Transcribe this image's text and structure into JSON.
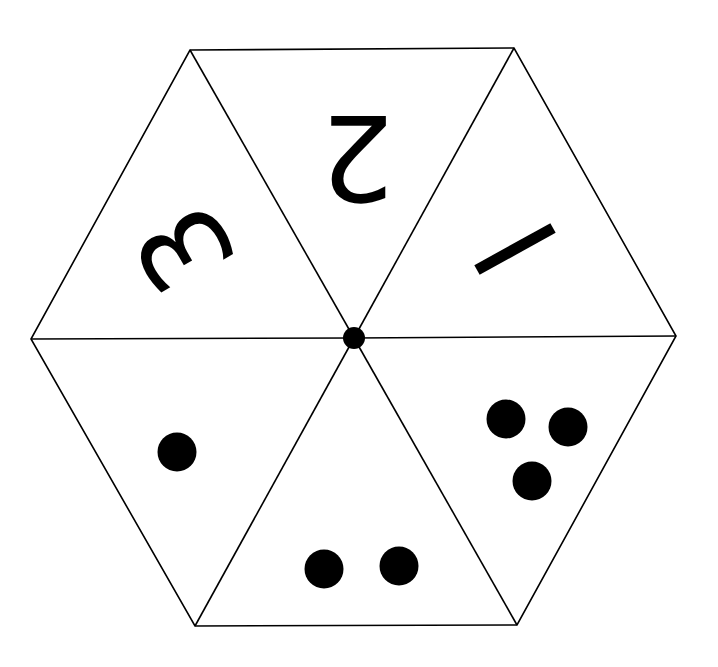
{
  "diagram": {
    "type": "hexagon spinner divided into six triangles",
    "colors": {
      "background": "#ffffff",
      "stroke": "#000000",
      "fill": "#000000"
    },
    "center": {
      "x": 354,
      "y": 338,
      "dot_radius": 11
    },
    "vertices": {
      "top_left": [
        190,
        50
      ],
      "top_right": [
        514,
        48
      ],
      "right": [
        676,
        336
      ],
      "bottom_right": [
        517,
        625
      ],
      "bottom_left": [
        195,
        626
      ],
      "left": [
        31,
        339
      ]
    },
    "sections": [
      {
        "position": "top",
        "label": "2",
        "kind": "numeral",
        "rotation": 180
      },
      {
        "position": "upper-left",
        "label": "3",
        "kind": "numeral",
        "rotation": -120
      },
      {
        "position": "upper-right",
        "label": "1",
        "kind": "numeral",
        "rotation": 120
      },
      {
        "position": "lower-left",
        "label": "1 dot",
        "kind": "dots",
        "count": 1
      },
      {
        "position": "bottom",
        "label": "2 dots",
        "kind": "dots",
        "count": 2
      },
      {
        "position": "lower-right",
        "label": "3 dots",
        "kind": "dots",
        "count": 3
      }
    ],
    "numerals": {
      "top": "2",
      "upper_left": "3",
      "upper_right": "1"
    }
  }
}
